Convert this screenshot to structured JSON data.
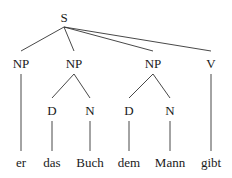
{
  "tree": {
    "root": {
      "label": "S",
      "x": 64,
      "y": 17
    },
    "phrases": [
      {
        "label": "NP",
        "x": 21,
        "y": 63
      },
      {
        "label": "NP",
        "x": 74,
        "y": 63
      },
      {
        "label": "NP",
        "x": 153,
        "y": 63
      },
      {
        "label": "V",
        "x": 211,
        "y": 63
      }
    ],
    "preterminals": [
      {
        "label": "D",
        "x": 52,
        "y": 110
      },
      {
        "label": "N",
        "x": 90,
        "y": 110
      },
      {
        "label": "D",
        "x": 129,
        "y": 110
      },
      {
        "label": "N",
        "x": 170,
        "y": 110
      }
    ],
    "words": [
      {
        "label": "er",
        "x": 21,
        "y": 163
      },
      {
        "label": "das",
        "x": 52,
        "y": 163
      },
      {
        "label": "Buch",
        "x": 90,
        "y": 163
      },
      {
        "label": "dem",
        "x": 129,
        "y": 163
      },
      {
        "label": "Mann",
        "x": 170,
        "y": 163
      },
      {
        "label": "gibt",
        "x": 211,
        "y": 163
      }
    ]
  }
}
